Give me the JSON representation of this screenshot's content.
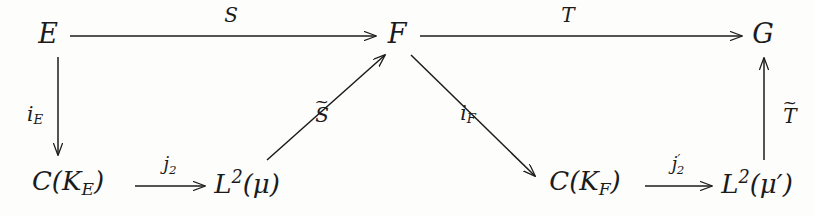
{
  "diagram": {
    "type": "commutative-diagram",
    "title": "",
    "background_color": "#fdfdfc",
    "ink_color": "#1b1b1b",
    "nodes": [
      {
        "id": "E",
        "label": "E",
        "x": 48,
        "y": 33
      },
      {
        "id": "F",
        "label": "F",
        "x": 397,
        "y": 33
      },
      {
        "id": "G",
        "label": "G",
        "x": 763,
        "y": 33
      },
      {
        "id": "CKE",
        "label": "C(K",
        "sub": "E",
        "close": ")",
        "x": 68,
        "y": 183
      },
      {
        "id": "L2mu",
        "label": "L",
        "sup": "2",
        "arg": "(μ)",
        "x": 247,
        "y": 183
      },
      {
        "id": "CKF",
        "label": "C(K",
        "sub": "F",
        "close": ")",
        "x": 585,
        "y": 183
      },
      {
        "id": "L2mup",
        "label": "L",
        "sup": "2",
        "arg": "(μ′)",
        "x": 757,
        "y": 183
      }
    ],
    "arrows": [
      {
        "id": "S",
        "from": "E",
        "to": "F",
        "label": "S",
        "kind": "horizontal-right"
      },
      {
        "id": "T",
        "from": "F",
        "to": "G",
        "label": "T",
        "kind": "horizontal-right"
      },
      {
        "id": "iE",
        "from": "E",
        "to": "CKE",
        "label": "i",
        "label_sub": "E",
        "kind": "vertical-down"
      },
      {
        "id": "j2",
        "from": "CKE",
        "to": "L2mu",
        "label": "j",
        "label_sub": "2",
        "kind": "horizontal-right"
      },
      {
        "id": "Stilde",
        "from": "L2mu",
        "to": "F",
        "label": "S",
        "label_tilde": true,
        "kind": "diagonal-up-right"
      },
      {
        "id": "iF",
        "from": "F",
        "to": "CKF",
        "label": "i",
        "label_sub": "F",
        "kind": "diagonal-down-right"
      },
      {
        "id": "j2prime",
        "from": "CKF",
        "to": "L2mup",
        "label": "j",
        "label_sub": "2",
        "label_prime": "′",
        "kind": "horizontal-right"
      },
      {
        "id": "Ttilde",
        "from": "L2mup",
        "to": "G",
        "label": "T",
        "label_tilde": true,
        "kind": "vertical-up"
      }
    ],
    "labels": {
      "S": "S",
      "T": "T",
      "i_E_base": "i",
      "i_E_sub": "E",
      "i_F_base": "i",
      "i_F_sub": "F",
      "j2_base": "j",
      "j2_sub": "2",
      "j2p_base": "j",
      "j2p_prime": "′",
      "j2p_sub": "2",
      "S_tilde_base": "S",
      "S_tilde_mark": "~",
      "T_tilde_base": "T",
      "T_tilde_mark": "~",
      "E": "E",
      "F": "F",
      "G": "G",
      "C_open": "C(K",
      "CKE_sub": "E",
      "CKF_sub": "F",
      "C_close": ")",
      "L_base": "L",
      "L_sup": "2",
      "mu": "(μ)",
      "mu_prime": "(μ′)"
    }
  }
}
